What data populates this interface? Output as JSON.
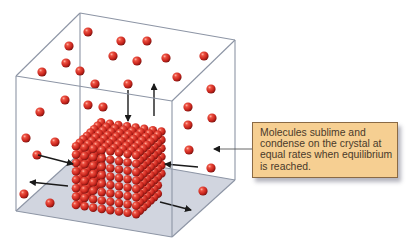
{
  "figure": {
    "colors": {
      "molecule": "#d6322a",
      "molecule_highlight": "#ff9a88",
      "box_edge": "#8d95a5",
      "floor": "#c9ced9",
      "arrow": "#1a1a1a",
      "callout_fill": "#f6cf92",
      "callout_border": "#8a6a45",
      "callout_text": "#4a3a2a"
    },
    "callout": {
      "text": "Molecules sublime and condense on the crystal at equal rates when equilibrium is reached.",
      "lines": [
        "Molecules sublime and",
        "condense on the crystal at",
        "equal rates when equilibrium",
        "is reached."
      ]
    }
  }
}
